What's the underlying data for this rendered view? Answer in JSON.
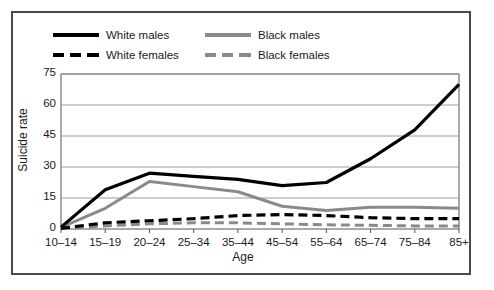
{
  "figure": {
    "frame_color": "#4a4a4a",
    "background": "#ffffff"
  },
  "legend": {
    "entries": [
      {
        "label": "White males",
        "color": "#000000",
        "style": "solid",
        "swatch": "sw-solid-black",
        "row": 0,
        "col": 0
      },
      {
        "label": "Black males",
        "color": "#8a8a8a",
        "style": "solid",
        "swatch": "sw-solid-gray",
        "row": 0,
        "col": 1
      },
      {
        "label": "White females",
        "color": "#000000",
        "style": "dashed",
        "swatch": "sw-dash-black",
        "row": 1,
        "col": 0
      },
      {
        "label": "Black females",
        "color": "#8a8a8a",
        "style": "dashed",
        "swatch": "sw-dash-gray",
        "row": 1,
        "col": 1
      }
    ]
  },
  "chart_data": {
    "type": "line",
    "title": "",
    "xlabel": "Age",
    "ylabel": "Suicide rate",
    "categories": [
      "10–14",
      "15–19",
      "20–24",
      "25–34",
      "35–44",
      "45–54",
      "55–64",
      "65–74",
      "75–84",
      "85+"
    ],
    "ylim": [
      0,
      75
    ],
    "yticks": [
      0,
      15,
      30,
      45,
      60,
      75
    ],
    "grid": "horizontal",
    "legend_position": "above-plot",
    "series": [
      {
        "name": "White males",
        "color": "#000000",
        "style": "solid",
        "width": 3.2,
        "values": [
          0.9,
          19,
          27,
          25.5,
          24,
          21,
          22.5,
          34,
          48,
          70
        ]
      },
      {
        "name": "Black males",
        "color": "#8a8a8a",
        "style": "solid",
        "width": 3.0,
        "values": [
          0.8,
          10,
          23,
          20.5,
          18,
          11,
          9,
          10.5,
          10.5,
          10
        ]
      },
      {
        "name": "White females",
        "color": "#000000",
        "style": "dashed",
        "width": 3.2,
        "values": [
          0.3,
          3,
          4,
          5,
          6.5,
          7,
          6.5,
          5.5,
          5,
          5
        ]
      },
      {
        "name": "Black females",
        "color": "#8a8a8a",
        "style": "dashed",
        "width": 3.0,
        "values": [
          0.2,
          1.5,
          2.5,
          3,
          3,
          2.5,
          2,
          1.8,
          1.5,
          1.5
        ]
      }
    ]
  }
}
